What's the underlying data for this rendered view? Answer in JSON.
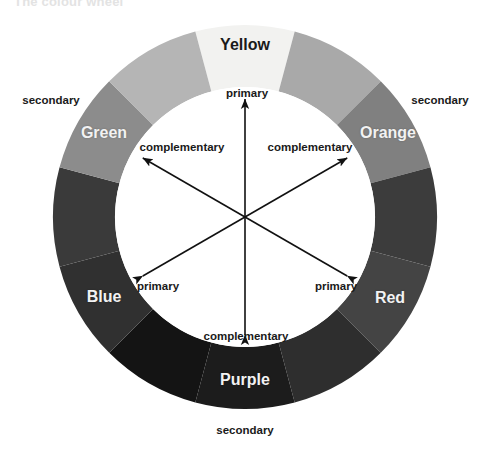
{
  "page": {
    "clipped_heading": "The colour wheel",
    "background": "#ffffff"
  },
  "wheel": {
    "center_x": 245,
    "center_y": 217,
    "outer_radius": 192,
    "inner_radius": 130,
    "segment_count": 12,
    "hub_fill": "#ffffff",
    "segments": [
      {
        "index": 0,
        "name": "Yellow",
        "named": true,
        "fill": "#f2f2f0",
        "start_deg": -15,
        "end_deg": 15
      },
      {
        "index": 1,
        "name": "Yellow-Orange",
        "named": false,
        "fill": "#a9a9a9",
        "start_deg": 15,
        "end_deg": 45
      },
      {
        "index": 2,
        "name": "Orange",
        "named": true,
        "fill": "#808080",
        "start_deg": 45,
        "end_deg": 75
      },
      {
        "index": 3,
        "name": "Red-Orange",
        "named": false,
        "fill": "#3c3c3c",
        "start_deg": 75,
        "end_deg": 105
      },
      {
        "index": 4,
        "name": "Red",
        "named": true,
        "fill": "#444444",
        "start_deg": 105,
        "end_deg": 135
      },
      {
        "index": 5,
        "name": "Red-Purple",
        "named": false,
        "fill": "#2e2e2e",
        "start_deg": 135,
        "end_deg": 165
      },
      {
        "index": 6,
        "name": "Purple",
        "named": true,
        "fill": "#1c1c1c",
        "start_deg": 165,
        "end_deg": 195
      },
      {
        "index": 7,
        "name": "Blue-Purple",
        "named": false,
        "fill": "#141414",
        "start_deg": 195,
        "end_deg": 225
      },
      {
        "index": 8,
        "name": "Blue",
        "named": true,
        "fill": "#303030",
        "start_deg": 225,
        "end_deg": 255
      },
      {
        "index": 9,
        "name": "Blue-Green",
        "named": false,
        "fill": "#3a3a3a",
        "start_deg": 255,
        "end_deg": 285
      },
      {
        "index": 10,
        "name": "Green",
        "named": true,
        "fill": "#8c8c8c",
        "start_deg": 285,
        "end_deg": 315
      },
      {
        "index": 11,
        "name": "Yellow-Green",
        "named": false,
        "fill": "#b5b5b5",
        "start_deg": 315,
        "end_deg": 345
      }
    ]
  },
  "ring_labels": [
    {
      "text": "Yellow",
      "x": 245,
      "y": 45,
      "style": "dark"
    },
    {
      "text": "Orange",
      "x": 388,
      "y": 133,
      "style": "light"
    },
    {
      "text": "Red",
      "x": 390,
      "y": 298,
      "style": "light"
    },
    {
      "text": "Purple",
      "x": 245,
      "y": 380,
      "style": "light"
    },
    {
      "text": "Blue",
      "x": 104,
      "y": 297,
      "style": "light"
    },
    {
      "text": "Green",
      "x": 104,
      "y": 133,
      "style": "light"
    }
  ],
  "outer_captions": [
    {
      "text": "secondary",
      "x": 51,
      "y": 100
    },
    {
      "text": "secondary",
      "x": 440,
      "y": 100
    },
    {
      "text": "secondary",
      "x": 245,
      "y": 430
    }
  ],
  "inner_captions": [
    {
      "text": "primary",
      "x": 247,
      "y": 93
    },
    {
      "text": "complementary",
      "x": 182,
      "y": 147
    },
    {
      "text": "complementary",
      "x": 310,
      "y": 147
    },
    {
      "text": "primary",
      "x": 158,
      "y": 286
    },
    {
      "text": "primary",
      "x": 336,
      "y": 286
    },
    {
      "text": "complementary",
      "x": 246,
      "y": 336
    }
  ],
  "arrows": {
    "stroke": "#111111",
    "stroke_width": 1.6,
    "length": 118,
    "axes_deg": [
      90,
      30,
      150
    ],
    "count": 3,
    "double_headed": true
  }
}
